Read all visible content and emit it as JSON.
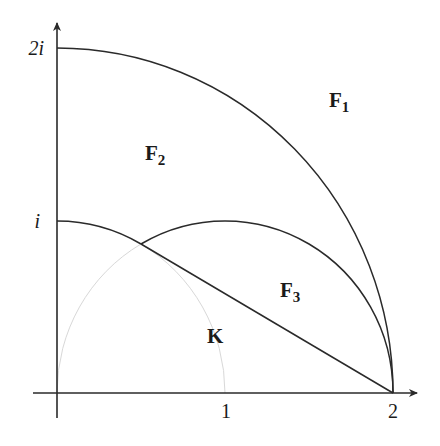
{
  "diagram": {
    "axes": {
      "x_ticks": [
        {
          "label": "1",
          "value": 1
        },
        {
          "label": "2",
          "value": 2
        }
      ],
      "y_ticks": [
        {
          "label": "i",
          "value": 1
        },
        {
          "label": "2i",
          "value": 2
        }
      ]
    },
    "regions": [
      {
        "name": "F",
        "sub": "1"
      },
      {
        "name": "F",
        "sub": "2"
      },
      {
        "name": "F",
        "sub": "3"
      },
      {
        "name": "K",
        "sub": ""
      }
    ],
    "curves": [
      {
        "desc": "quarter circle |z|=2 from 2i to 2"
      },
      {
        "desc": "arc |z|=1 from i to e^{i pi/3}"
      },
      {
        "desc": "arc |z-1|=1 from e^{i pi/3} to 2"
      },
      {
        "desc": "segment from e^{i pi/3} to 2"
      },
      {
        "desc": "faint arc |z-1|=1 from 0 to e^{i pi/3}"
      },
      {
        "desc": "faint arc |z|=1 from e^{i pi/3} to 1"
      }
    ],
    "colors": {
      "line": "#2a2a2a",
      "faint": "#d8d8d8"
    }
  }
}
